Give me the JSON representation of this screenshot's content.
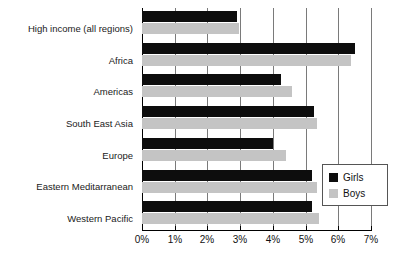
{
  "chart_data": {
    "type": "bar",
    "orientation": "horizontal",
    "title": "",
    "xlabel": "",
    "ylabel": "",
    "xlim": [
      0,
      7
    ],
    "xtick_labels": [
      "0%",
      "1%",
      "2%",
      "3%",
      "4%",
      "5%",
      "6%",
      "7%"
    ],
    "xtick_values": [
      0,
      1,
      2,
      3,
      4,
      5,
      6,
      7
    ],
    "grid": true,
    "grid_axis": "x",
    "legend_position": "right-inside",
    "categories": [
      "High income (all regions)",
      "Africa",
      "Americas",
      "South East Asia",
      "Europe",
      "Eastern Meditarranean",
      "Western Pacific"
    ],
    "series": [
      {
        "name": "Girls",
        "color": "#0d0d0d",
        "values": [
          2.9,
          6.5,
          4.25,
          5.25,
          4.0,
          5.2,
          5.2
        ]
      },
      {
        "name": "Boys",
        "color": "#c4c4c4",
        "values": [
          2.95,
          6.4,
          4.6,
          5.35,
          4.4,
          5.35,
          5.4
        ]
      }
    ]
  },
  "legend": {
    "entries": [
      {
        "label": "Girls",
        "swatch": "girls"
      },
      {
        "label": "Boys",
        "swatch": "boys"
      }
    ]
  }
}
